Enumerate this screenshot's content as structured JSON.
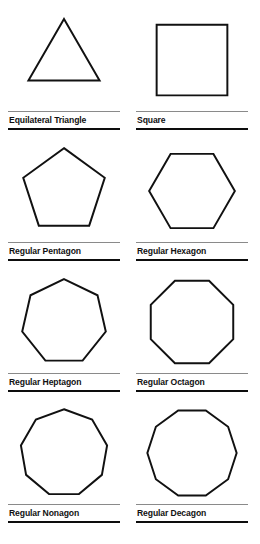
{
  "page": {
    "background_color": "#ffffff",
    "stroke_color": "#111111",
    "rule_top_color": "#8a8a8a",
    "rule_bottom_color": "#0d0d0d",
    "columns": 2,
    "rows": 4
  },
  "figures": [
    {
      "id": "equilateral-triangle",
      "label": "Equilateral Triangle",
      "sides": 3,
      "icon": "triangle-icon",
      "orientation": "point-up",
      "start_angle_deg": -90,
      "radius": 46,
      "scale_x": 1.0,
      "scale_y": 1.0
    },
    {
      "id": "square",
      "label": "Square",
      "sides": 4,
      "icon": "square-icon",
      "orientation": "flat-top",
      "start_angle_deg": -135,
      "radius": 56,
      "scale_x": 1.0,
      "scale_y": 1.0
    },
    {
      "id": "regular-pentagon",
      "label": "Regular Pentagon",
      "sides": 5,
      "icon": "pentagon-icon",
      "orientation": "point-up",
      "start_angle_deg": -90,
      "radius": 48,
      "scale_x": 1.0,
      "scale_y": 1.0
    },
    {
      "id": "regular-hexagon",
      "label": "Regular Hexagon",
      "sides": 6,
      "icon": "hexagon-icon",
      "orientation": "flat-top",
      "start_angle_deg": -120,
      "radius": 48,
      "scale_x": 1.0,
      "scale_y": 1.0
    },
    {
      "id": "regular-heptagon",
      "label": "Regular Heptagon",
      "sides": 7,
      "icon": "heptagon-icon",
      "orientation": "point-up",
      "start_angle_deg": -90,
      "radius": 48,
      "scale_x": 1.0,
      "scale_y": 1.0
    },
    {
      "id": "regular-octagon",
      "label": "Regular Octagon",
      "sides": 8,
      "icon": "octagon-icon",
      "orientation": "flat-top",
      "start_angle_deg": -112.5,
      "radius": 50,
      "scale_x": 1.0,
      "scale_y": 1.0
    },
    {
      "id": "regular-nonagon",
      "label": "Regular Nonagon",
      "sides": 9,
      "icon": "nonagon-icon",
      "orientation": "point-up",
      "start_angle_deg": -90,
      "radius": 49,
      "scale_x": 1.0,
      "scale_y": 1.0
    },
    {
      "id": "regular-decagon",
      "label": "Regular Decagon",
      "sides": 10,
      "icon": "decagon-icon",
      "orientation": "flat-top",
      "start_angle_deg": -108,
      "radius": 50,
      "scale_x": 1.0,
      "scale_y": 1.0
    }
  ]
}
